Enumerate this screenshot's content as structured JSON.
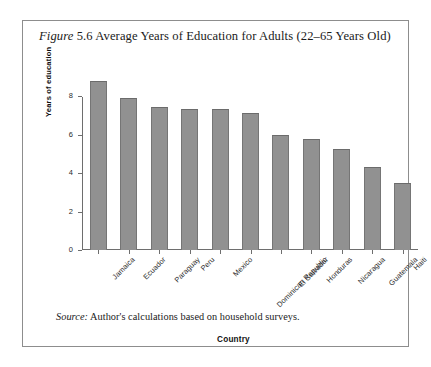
{
  "figure": {
    "title_prefix": "Figure",
    "title_rest": "5.6 Average Years of Education for Adults (22–65 Years Old)",
    "source_prefix": "Source:",
    "source_rest": "Author's calculations based on household surveys."
  },
  "chart_data": {
    "type": "bar",
    "title": "Figure 5.6 Average Years of Education for Adults (22–65 Years Old)",
    "xlabel": "Country",
    "ylabel": "Years of education",
    "ylim": [
      0,
      9
    ],
    "yticks": [
      0,
      2,
      4,
      6,
      8
    ],
    "ytick_labels": [
      "0",
      "2",
      "4",
      "6",
      "8"
    ],
    "grid": false,
    "legend": false,
    "bar_color": "#919191",
    "categories": [
      "Jamaica",
      "Ecuador",
      "Paraguay",
      "Peru",
      "Mexico",
      "Dominican Republic",
      "El Salvador",
      "Honduras",
      "Nicaragua",
      "Guatemala",
      "Haiti"
    ],
    "values": [
      8.8,
      7.9,
      7.45,
      7.35,
      7.35,
      7.15,
      6.0,
      5.8,
      5.25,
      4.3,
      3.5
    ]
  }
}
